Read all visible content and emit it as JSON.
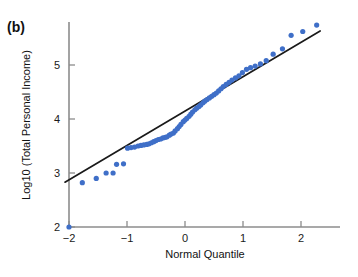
{
  "figure": {
    "panel_label": "(b)",
    "background_color": "#ffffff"
  },
  "chart_data": {
    "type": "scatter",
    "title": "",
    "subtitle": "",
    "xlabel": "Normal Quantile",
    "ylabel": "Log10 (Total Personal Income)",
    "xlim": [
      -2.2,
      2.45
    ],
    "ylim": [
      1.92,
      5.95
    ],
    "xticks": [
      -2,
      -1,
      0,
      1,
      2
    ],
    "xticklabels": [
      "−2",
      "−1",
      "0",
      "1",
      "2"
    ],
    "yticks": [
      2,
      3,
      4,
      5
    ],
    "yticklabels": [
      "2",
      "3",
      "4",
      "5"
    ],
    "grid": false,
    "legend": null,
    "point_color": "#3f6fc8",
    "point_size": 2.6,
    "line_color": "#1a1a1a",
    "axis_color": "#808080",
    "series": [
      {
        "name": "Q-Q points",
        "x": [
          -2.0,
          -1.77,
          -1.53,
          -1.36,
          -1.24,
          -1.18,
          -1.06,
          -0.99,
          -0.93,
          -0.87,
          -0.81,
          -0.76,
          -0.71,
          -0.66,
          -0.62,
          -0.58,
          -0.54,
          -0.5,
          -0.46,
          -0.42,
          -0.38,
          -0.34,
          -0.31,
          -0.27,
          -0.24,
          -0.2,
          -0.17,
          -0.13,
          -0.1,
          -0.07,
          -0.03,
          0.0,
          0.03,
          0.07,
          0.1,
          0.13,
          0.17,
          0.2,
          0.24,
          0.27,
          0.31,
          0.34,
          0.38,
          0.42,
          0.46,
          0.5,
          0.54,
          0.58,
          0.62,
          0.66,
          0.71,
          0.76,
          0.81,
          0.87,
          0.93,
          0.99,
          1.06,
          1.13,
          1.21,
          1.3,
          1.4,
          1.52,
          1.68,
          1.83,
          2.03,
          2.27
        ],
        "y": [
          2.0,
          2.82,
          2.9,
          3.0,
          3.0,
          3.16,
          3.17,
          3.46,
          3.47,
          3.48,
          3.5,
          3.51,
          3.52,
          3.53,
          3.54,
          3.56,
          3.58,
          3.6,
          3.62,
          3.63,
          3.65,
          3.66,
          3.67,
          3.7,
          3.72,
          3.74,
          3.78,
          3.82,
          3.86,
          3.9,
          3.95,
          3.98,
          4.01,
          4.05,
          4.09,
          4.13,
          4.17,
          4.2,
          4.23,
          4.26,
          4.3,
          4.33,
          4.36,
          4.39,
          4.42,
          4.45,
          4.48,
          4.52,
          4.56,
          4.6,
          4.64,
          4.68,
          4.72,
          4.76,
          4.8,
          4.86,
          4.92,
          4.95,
          4.98,
          5.02,
          5.08,
          5.2,
          5.3,
          5.55,
          5.62,
          5.74
        ]
      }
    ],
    "reference_line": {
      "name": "fit-line",
      "x": [
        -2.07,
        2.33
      ],
      "y": [
        2.83,
        5.63
      ]
    }
  }
}
